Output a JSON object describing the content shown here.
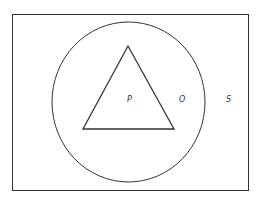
{
  "diagram": {
    "type": "venn-nested-sets",
    "colors": {
      "stroke": "#333333",
      "background": "#ffffff"
    },
    "universe": {
      "label": "S",
      "x": 12,
      "y": 14,
      "width": 236,
      "height": 176
    },
    "circle": {
      "label": "O",
      "cx": 128.5,
      "cy": 102,
      "rx": 76.5,
      "ry": 80
    },
    "triangle": {
      "label": "P",
      "points": "128,46 83,129 174,129"
    },
    "labels": [
      {
        "text": "P",
        "x": 127,
        "y": 102
      },
      {
        "text": "O",
        "x": 179,
        "y": 102
      },
      {
        "text": "S",
        "x": 226,
        "y": 102
      }
    ]
  }
}
